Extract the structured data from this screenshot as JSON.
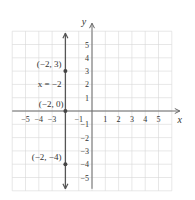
{
  "chart_data": {
    "type": "line",
    "title": "",
    "xlabel": "x",
    "ylabel": "y",
    "xlim": [
      -6,
      6
    ],
    "ylim": [
      -6,
      6
    ],
    "grid": true,
    "x_ticks": [
      -5,
      -4,
      -3,
      -1,
      1,
      2,
      3,
      4,
      5
    ],
    "y_ticks": [
      5,
      4,
      3,
      2,
      1,
      -1,
      -2,
      -3,
      -4,
      -5
    ],
    "x_tick_labels": [
      "−5",
      "−4",
      "−3",
      "−1",
      "1",
      "2",
      "3",
      "4",
      "5"
    ],
    "y_tick_labels": [
      "5",
      "4",
      "3",
      "2",
      "1",
      "−1",
      "−2",
      "−3",
      "−4",
      "−5"
    ],
    "series": [
      {
        "name": "x = −2",
        "kind": "vertical-line",
        "x": -2,
        "arrows": "both",
        "color": "#555555"
      }
    ],
    "points": [
      {
        "x": -2,
        "y": 3,
        "label": "(−2, 3)"
      },
      {
        "x": -2,
        "y": 0,
        "label": "(−2, 0)"
      },
      {
        "x": -2,
        "y": -4,
        "label": "(−2, −4)"
      }
    ],
    "annotations": [
      {
        "text": "x = −2",
        "x": -2,
        "y": 2,
        "position": "left"
      }
    ]
  },
  "labels": {
    "x_axis": "x",
    "y_axis": "y",
    "line_equation": "x = −2",
    "point_top": "(−2, 3)",
    "point_origin": "(−2, 0)",
    "point_bottom": "(−2, −4)"
  },
  "colors": {
    "grid": "#d6d6d6",
    "axis": "#6a6a6a",
    "line": "#555555",
    "point": "#444444",
    "text": "#333333"
  }
}
